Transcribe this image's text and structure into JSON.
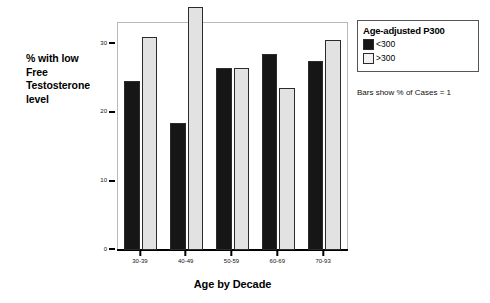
{
  "chart_data": {
    "type": "bar",
    "title": "",
    "xlabel": "Age by Decade",
    "ylabel": "% with low Free Testosterone level",
    "ylabel_lines": [
      "% with low",
      "Free",
      "Testosterone",
      "level"
    ],
    "categories": [
      "30-39",
      "40-49",
      "50-59",
      "60-69",
      "70-93"
    ],
    "series": [
      {
        "name": "<300",
        "color": "#161616",
        "values": [
          24.5,
          18.5,
          26.5,
          28.5,
          27.5
        ]
      },
      {
        "name": ">300",
        "color": "#e2e2e2",
        "values": [
          31.0,
          35.3,
          26.5,
          23.5,
          30.5
        ]
      }
    ],
    "ylim": [
      0,
      33
    ],
    "yticks": [
      0,
      10,
      20,
      30
    ],
    "ytick_labels": [
      "0",
      "10",
      "20",
      "30"
    ],
    "grid": false,
    "legend_position": "top-right",
    "annotations": [
      "Bars show % of Cases = 1"
    ]
  },
  "legend": {
    "title": "Age-adjusted P300",
    "items": [
      {
        "label": "<300",
        "swatch": "dark"
      },
      {
        "label": ">300",
        "swatch": "light"
      }
    ]
  },
  "caption": "Bars show % of Cases = 1",
  "axes": {
    "x_title": "Age by Decade"
  }
}
